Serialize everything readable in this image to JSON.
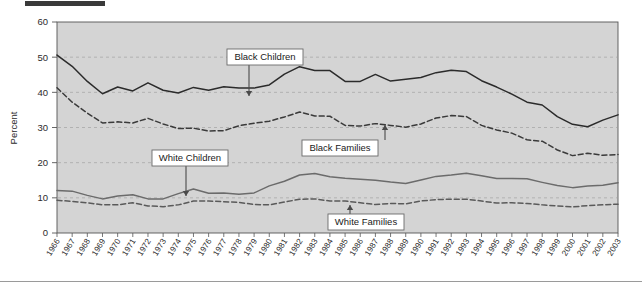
{
  "chart_data": {
    "type": "line",
    "title": "",
    "xlabel": "",
    "ylabel": "Percent",
    "ylim": [
      0,
      60
    ],
    "yticks": [
      0,
      10,
      20,
      30,
      40,
      50,
      60
    ],
    "grid": true,
    "legend_position": "inline-callouts",
    "x": [
      1966,
      1967,
      1968,
      1969,
      1970,
      1971,
      1972,
      1973,
      1974,
      1975,
      1976,
      1977,
      1978,
      1979,
      1980,
      1981,
      1982,
      1983,
      1984,
      1985,
      1986,
      1987,
      1988,
      1989,
      1990,
      1991,
      1992,
      1993,
      1994,
      1995,
      1996,
      1997,
      1998,
      1999,
      2000,
      2001,
      2002,
      2003
    ],
    "series": [
      {
        "name": "Black Children",
        "style": "solid",
        "color": "#2b2b2b",
        "values": [
          50.6,
          47.4,
          43.1,
          39.6,
          41.5,
          40.4,
          42.7,
          40.6,
          39.8,
          41.4,
          40.6,
          41.6,
          41.2,
          41.2,
          42.1,
          45.2,
          47.3,
          46.2,
          46.2,
          43.1,
          43.1,
          45.1,
          43.2,
          43.7,
          44.2,
          45.6,
          46.3,
          45.9,
          43.3,
          41.5,
          39.5,
          37.2,
          36.4,
          33.1,
          30.9,
          30.2,
          32.1,
          33.6
        ]
      },
      {
        "name": "Black Families",
        "style": "dashed",
        "color": "#3a3a3a",
        "values": [
          41.3,
          37.2,
          34.1,
          31.3,
          31.6,
          31.3,
          32.6,
          31.0,
          29.7,
          29.8,
          29.0,
          29.1,
          30.5,
          31.2,
          31.8,
          33.0,
          34.4,
          33.3,
          33.2,
          30.6,
          30.4,
          31.1,
          30.6,
          30.1,
          31.0,
          32.7,
          33.4,
          33.1,
          30.6,
          29.3,
          28.4,
          26.5,
          26.1,
          23.6,
          22.0,
          22.7,
          22.1,
          22.3
        ]
      },
      {
        "name": "White Children",
        "style": "solid",
        "color": "#6b6b6b",
        "values": [
          12.1,
          11.9,
          10.7,
          9.7,
          10.5,
          10.9,
          9.7,
          9.7,
          11.2,
          12.5,
          11.3,
          11.4,
          11.0,
          11.4,
          13.4,
          14.7,
          16.5,
          16.9,
          16.0,
          15.6,
          15.3,
          15.0,
          14.5,
          14.1,
          15.1,
          16.1,
          16.5,
          17.0,
          16.3,
          15.5,
          15.5,
          15.4,
          14.4,
          13.5,
          12.9,
          13.4,
          13.6,
          14.3
        ]
      },
      {
        "name": "White Families",
        "style": "dashed",
        "color": "#5a5a5a",
        "values": [
          9.3,
          9.0,
          8.6,
          8.0,
          8.0,
          8.6,
          7.7,
          7.5,
          8.0,
          9.1,
          9.1,
          8.9,
          8.7,
          8.1,
          8.0,
          8.8,
          9.6,
          9.7,
          9.1,
          9.1,
          8.6,
          8.1,
          8.4,
          8.3,
          9.1,
          9.5,
          9.6,
          9.6,
          9.1,
          8.5,
          8.6,
          8.4,
          8.0,
          7.7,
          7.4,
          7.8,
          8.0,
          8.2
        ]
      }
    ],
    "callouts": [
      {
        "label": "Black Children",
        "arrow": "down"
      },
      {
        "label": "Black Families",
        "arrow": "up"
      },
      {
        "label": "White Children",
        "arrow": "down"
      },
      {
        "label": "White Families",
        "arrow": "up"
      }
    ]
  },
  "colors": {
    "plot_background": "#d4d4d4",
    "grid": "#a8a8a8",
    "axis": "#555555",
    "callout_fill": "#ffffff",
    "callout_border": "#6b6b6b",
    "top_bar": "#3a3a3a"
  }
}
